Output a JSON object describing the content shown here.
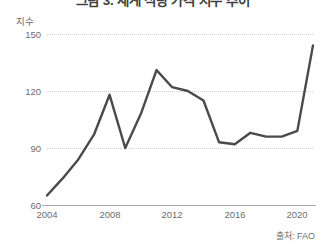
{
  "title": "그림 3. 세계 식량 가격 지수 추이",
  "unit_label": "지수",
  "source": "출처: FAO",
  "axis": {
    "y_ticks": [
      "150",
      "120",
      "90",
      "60"
    ],
    "x_ticks": [
      "2004",
      "2008",
      "2012",
      "2016",
      "2020"
    ]
  },
  "style": {
    "line_color": "#4a4a4c",
    "grid_color": "#d2d2d4",
    "axis_color": "#a9a9ab",
    "text_color": "#6d6d6f",
    "background": "#ffffff"
  },
  "chart_data": {
    "type": "line",
    "title": "그림 3. 세계 식량 가격 지수 추이",
    "xlabel": "",
    "ylabel": "지수",
    "ylim": [
      60,
      150
    ],
    "xlim": [
      2004,
      2021
    ],
    "grid": true,
    "legend": "none",
    "annotations": [
      "출처: FAO"
    ],
    "x": [
      2004,
      2005,
      2006,
      2007,
      2008,
      2009,
      2010,
      2011,
      2012,
      2013,
      2014,
      2015,
      2016,
      2017,
      2018,
      2019,
      2020,
      2021
    ],
    "series": [
      {
        "name": "세계 식량 가격 지수",
        "values": [
          65,
          74,
          84,
          97,
          118,
          90,
          108,
          131,
          122,
          120,
          115,
          93,
          92,
          98,
          96,
          96,
          99,
          144
        ]
      }
    ]
  }
}
